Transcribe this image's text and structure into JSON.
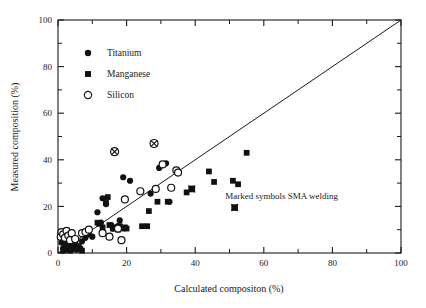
{
  "chart_data": {
    "type": "scatter",
    "title": "",
    "xlabel": "Calculated compositon (%)",
    "ylabel": "Measured composition (%)",
    "xlim": [
      0,
      100
    ],
    "ylim": [
      0,
      100
    ],
    "xticks": [
      0,
      20,
      40,
      60,
      80,
      100
    ],
    "yticks": [
      0,
      20,
      40,
      60,
      80,
      100
    ],
    "xtick_labels": [
      "0",
      "20",
      "40",
      "60",
      "80",
      "100"
    ],
    "ytick_labels": [
      "0",
      "20",
      "40",
      "60",
      "80",
      "100"
    ],
    "minor_ticks": true,
    "grid": false,
    "legend_position": "upper-left-inside",
    "reference_line": {
      "label": "1:1 parity line",
      "from": [
        0,
        0
      ],
      "to": [
        100,
        100
      ]
    },
    "annotation": "Marked symbols SMA welding",
    "series": [
      {
        "name": "Titanium",
        "marker": "filled-circle",
        "color": "#111111",
        "points": [
          [
            1.0,
            4.5
          ],
          [
            1.2,
            6.5
          ],
          [
            1.5,
            2.0
          ],
          [
            1.8,
            8.0
          ],
          [
            2.0,
            5.0
          ],
          [
            2.2,
            3.0
          ],
          [
            2.5,
            6.0
          ],
          [
            2.8,
            1.5
          ],
          [
            3.0,
            4.0
          ],
          [
            3.2,
            7.0
          ],
          [
            3.5,
            2.5
          ],
          [
            3.8,
            5.5
          ],
          [
            4.0,
            3.5
          ],
          [
            4.5,
            2.0
          ],
          [
            5.0,
            4.5
          ],
          [
            5.5,
            1.5
          ],
          [
            6.0,
            3.0
          ],
          [
            6.5,
            2.0
          ],
          [
            7.0,
            5.0
          ],
          [
            8.0,
            6.5
          ],
          [
            9.0,
            8.0
          ],
          [
            10.0,
            7.0
          ],
          [
            11.5,
            17.5
          ],
          [
            12.5,
            13.0
          ],
          [
            13.0,
            23.5
          ],
          [
            14.0,
            21.0
          ],
          [
            15.5,
            12.0
          ],
          [
            16.0,
            10.5
          ],
          [
            17.5,
            11.5
          ],
          [
            18.0,
            14.0
          ],
          [
            19.0,
            32.5
          ],
          [
            21.0,
            31.0
          ],
          [
            27.0,
            25.5
          ],
          [
            29.5,
            36.5
          ],
          [
            31.5,
            38.5
          ],
          [
            32.5,
            22.0
          ]
        ]
      },
      {
        "name": "Manganese",
        "marker": "filled-square",
        "color": "#111111",
        "points": [
          [
            1.5,
            1.0
          ],
          [
            2.0,
            2.5
          ],
          [
            2.5,
            1.5
          ],
          [
            3.0,
            3.5
          ],
          [
            3.5,
            1.0
          ],
          [
            4.0,
            2.0
          ],
          [
            4.5,
            3.0
          ],
          [
            5.0,
            1.5
          ],
          [
            6.0,
            2.5
          ],
          [
            7.0,
            1.0
          ],
          [
            11.5,
            13.0
          ],
          [
            12.0,
            12.5
          ],
          [
            13.0,
            11.0
          ],
          [
            14.0,
            21.5
          ],
          [
            14.5,
            24.0
          ],
          [
            15.0,
            12.0
          ],
          [
            16.0,
            10.5
          ],
          [
            17.0,
            11.0
          ],
          [
            17.5,
            10.0
          ],
          [
            18.0,
            11.5
          ],
          [
            19.0,
            10.5
          ],
          [
            19.5,
            11.0
          ],
          [
            20.0,
            10.5
          ],
          [
            24.5,
            11.5
          ],
          [
            26.0,
            11.5
          ],
          [
            26.5,
            18.0
          ],
          [
            29.0,
            22.0
          ],
          [
            32.0,
            22.0
          ],
          [
            37.5,
            26.0
          ],
          [
            39.0,
            27.5
          ],
          [
            44.0,
            35.0
          ],
          [
            45.5,
            30.5
          ],
          [
            51.0,
            31.0
          ],
          [
            52.5,
            29.5
          ],
          [
            55.0,
            43.0
          ]
        ]
      },
      {
        "name": "Silicon",
        "marker": "open-circle",
        "color": "#111111",
        "points": [
          [
            0.8,
            7.0
          ],
          [
            1.0,
            9.0
          ],
          [
            1.5,
            8.0
          ],
          [
            2.0,
            6.5
          ],
          [
            2.5,
            9.5
          ],
          [
            3.0,
            7.5
          ],
          [
            3.5,
            5.5
          ],
          [
            4.0,
            8.5
          ],
          [
            5.0,
            6.0
          ],
          [
            7.0,
            8.5
          ],
          [
            8.0,
            9.0
          ],
          [
            9.0,
            10.0
          ],
          [
            13.0,
            8.5
          ],
          [
            15.0,
            7.0
          ],
          [
            17.5,
            10.5
          ],
          [
            18.5,
            5.5
          ],
          [
            19.5,
            23.0
          ],
          [
            24.0,
            26.5
          ],
          [
            28.5,
            27.5
          ],
          [
            30.5,
            38.0
          ],
          [
            33.0,
            28.0
          ],
          [
            34.5,
            35.5
          ],
          [
            35.0,
            34.5
          ]
        ]
      }
    ],
    "marked_points": [
      {
        "x": 16.5,
        "y": 43.5,
        "marker": "open-circle",
        "note": "SMA welding"
      },
      {
        "x": 28.0,
        "y": 47.0,
        "marker": "open-circle",
        "note": "SMA welding"
      },
      {
        "x": 39.0,
        "y": 27.5,
        "marker": "filled-square",
        "note": "SMA welding"
      },
      {
        "x": 51.5,
        "y": 19.5,
        "marker": "filled-square",
        "note": "SMA welding"
      }
    ]
  },
  "legend": {
    "items": [
      {
        "label": "Titanium",
        "marker": "filled-circle"
      },
      {
        "label": "Manganese",
        "marker": "filled-square"
      },
      {
        "label": "Silicon",
        "marker": "open-circle"
      }
    ]
  },
  "annotation": {
    "text": "Marked symbols SMA welding"
  },
  "axes": {
    "x_title": "Calculated compositon (%)",
    "y_title": "Measured composition (%)"
  }
}
